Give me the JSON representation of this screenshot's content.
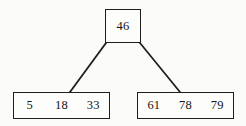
{
  "diagram": {
    "background_color": "#fbfbf9",
    "stroke_color": "#1e1e1e",
    "nodes": {
      "root": {
        "name": "root-node",
        "keys": [
          "46"
        ]
      },
      "leaf_left": {
        "name": "left-leaf-node",
        "keys": [
          "5",
          "18",
          "33"
        ]
      },
      "leaf_right": {
        "name": "right-leaf-node",
        "keys": [
          "61",
          "78",
          "79"
        ]
      }
    },
    "edges": [
      {
        "name": "edge-root-to-left-leaf",
        "from": "root",
        "to": "leaf_left"
      },
      {
        "name": "edge-root-to-right-leaf",
        "from": "root",
        "to": "leaf_right"
      }
    ]
  }
}
